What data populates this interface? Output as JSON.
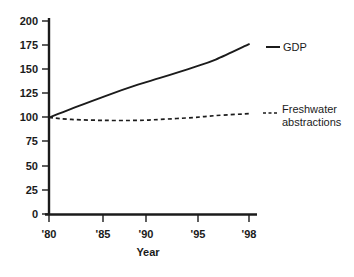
{
  "chart_data": {
    "type": "line",
    "title": "",
    "subtitle": "",
    "xlabel": "Year",
    "ylabel": "",
    "xlim": [
      1980,
      1998
    ],
    "ylim": [
      0,
      200
    ],
    "grid": false,
    "legend_position": "right-inline",
    "x": [
      1980,
      1985,
      1990,
      1995,
      1998
    ],
    "x_tick_labels": [
      "'80",
      "'85",
      "'90",
      "'95",
      "'98"
    ],
    "y_ticks": [
      0,
      25,
      50,
      75,
      100,
      125,
      150,
      175,
      200
    ],
    "y_tick_labels": [
      "0",
      "25",
      "50",
      "75",
      "100",
      "125",
      "150",
      "175",
      "200"
    ],
    "series": [
      {
        "name": "GDP",
        "style": "solid",
        "color": "#1b1b1b",
        "x": [
          1980,
          1982,
          1985,
          1988,
          1990,
          1993,
          1995,
          1998
        ],
        "values": [
          100,
          109,
          122,
          134,
          141,
          152,
          160,
          176
        ]
      },
      {
        "name": "Freshwater abstractions",
        "style": "dashed",
        "color": "#1b1b1b",
        "x": [
          1980,
          1982,
          1985,
          1988,
          1990,
          1993,
          1995,
          1998
        ],
        "values": [
          100,
          98,
          97,
          97,
          98,
          100,
          102,
          104
        ]
      }
    ],
    "annotations": [
      {
        "name": "gdp-label",
        "text": "GDP"
      },
      {
        "name": "freshwater-label-line1",
        "text": "Freshwater"
      },
      {
        "name": "freshwater-label-line2",
        "text": "abstractions"
      }
    ]
  },
  "legend": {
    "gdp": "GDP",
    "freshwater_line1": "Freshwater",
    "freshwater_line2": "abstractions"
  },
  "axes": {
    "x_title": "Year",
    "y_labels": {
      "t0": "0",
      "t25": "25",
      "t50": "50",
      "t75": "75",
      "t100": "100",
      "t125": "125",
      "t150": "150",
      "t175": "175",
      "t200": "200"
    },
    "x_labels": {
      "t80": "'80",
      "t85": "'85",
      "t90": "'90",
      "t95": "'95",
      "t98": "'98"
    }
  },
  "colors": {
    "ink": "#1b1b1b",
    "background": "#ffffff"
  }
}
